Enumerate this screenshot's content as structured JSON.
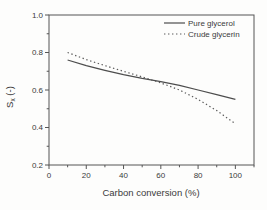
{
  "figure": {
    "kind": "scientific-line-plot",
    "background": "#fdfdfc",
    "frame_color": "#555555",
    "text_color": "#3b3b3b",
    "line_color": "#4d4d4d"
  },
  "labels": {
    "ylabel_main": "S",
    "ylabel_sub": "x",
    "ylabel_unit": " (-)"
  },
  "chart_data": {
    "type": "line",
    "title": "",
    "xlabel": "Carbon conversion (%)",
    "ylabel": "Sx (-)",
    "xlim": [
      0,
      110
    ],
    "ylim": [
      0.2,
      1.0
    ],
    "x_major_ticks": [
      0,
      20,
      40,
      60,
      80,
      100
    ],
    "x_minor_ticks": [
      10,
      30,
      50,
      70,
      90,
      110
    ],
    "y_major_ticks": [
      0.2,
      0.4,
      0.6,
      0.8,
      1.0
    ],
    "y_major_tick_labels": [
      "0.2",
      "0.4",
      "0.6",
      "0.8",
      "1.0"
    ],
    "y_minor_ticks": [
      0.3,
      0.5,
      0.7,
      0.9
    ],
    "grid": false,
    "legend_position": "top-right-inside",
    "x": [
      10,
      20,
      30,
      40,
      50,
      60,
      70,
      80,
      90,
      100
    ],
    "series": [
      {
        "name": "Pure glycerol",
        "style": "solid",
        "color": "#4d4d4d",
        "values": [
          0.76,
          0.73,
          0.705,
          0.682,
          0.662,
          0.645,
          0.625,
          0.6,
          0.575,
          0.55
        ]
      },
      {
        "name": "Crude glycerin",
        "style": "dotted",
        "color": "#5a5a5a",
        "values": [
          0.8,
          0.762,
          0.73,
          0.7,
          0.67,
          0.638,
          0.6,
          0.55,
          0.49,
          0.42
        ]
      }
    ]
  }
}
